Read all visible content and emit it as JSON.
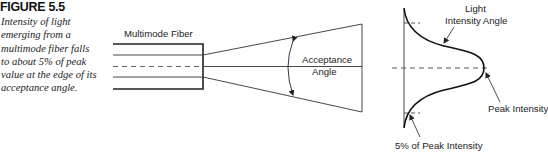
{
  "figure": {
    "title": "FIGURE 5.5",
    "caption_lines": [
      "Intensity of light",
      "emerging from a",
      "multimode fiber falls",
      "to about 5% of peak",
      "value at the edge of its",
      "acceptance angle."
    ]
  },
  "diagram": {
    "fiber_label": "Multimode Fiber",
    "acceptance_label_line1": "Acceptance",
    "acceptance_label_line2": "Angle",
    "intensity_label_line1": "Light",
    "intensity_label_line2": "Intensity Angle",
    "peak_label": "Peak Intensity",
    "five_percent_label": "5% of Peak Intensity"
  },
  "colors": {
    "line": "#222222",
    "text": "#222222",
    "background": "#ffffff"
  }
}
